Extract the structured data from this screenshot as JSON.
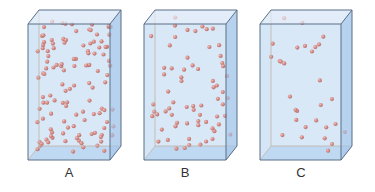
{
  "figure": {
    "colors": {
      "box_fill": "#cfe2f5",
      "box_side": "#a9c9ec",
      "box_top": "#e3eefa",
      "box_bottom": "#b9d4f0",
      "edge": "#5a6f86",
      "back_edge": "#b89a7a",
      "particle": "#d9543f",
      "particle_highlight": "#f4a08c"
    },
    "containers": [
      {
        "label": "A",
        "particle_count": 120,
        "density": "high"
      },
      {
        "label": "B",
        "particle_count": 68,
        "density": "medium"
      },
      {
        "label": "C",
        "particle_count": 30,
        "density": "low"
      }
    ]
  }
}
